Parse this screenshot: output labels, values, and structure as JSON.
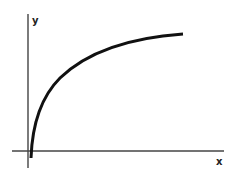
{
  "diagram": {
    "type": "function-curve",
    "axes": {
      "x_label": "x",
      "y_label": "y"
    },
    "colors": {
      "background": "#ffffff",
      "axis": "#444444",
      "curve": "#111111",
      "label": "#222222"
    }
  }
}
